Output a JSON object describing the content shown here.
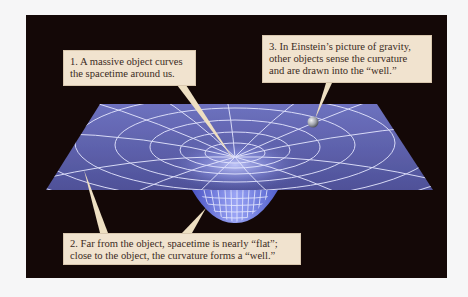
{
  "figure": {
    "colors": {
      "page_background": "#f6f6f7",
      "panel_background": "#140807",
      "sheet_fill": "#5b5ea8",
      "grid_lines": "#e6e8ff",
      "well_fill": "#7d86e0",
      "callout_fill": "#f1e3cf",
      "callout_text": "#3a2a22",
      "pointer_fill": "#eedfc2",
      "ball": "#b8bcc4"
    },
    "callouts": [
      {
        "id": "1",
        "lines": [
          "1.  A massive object curves",
          "the spacetime around us."
        ]
      },
      {
        "id": "2",
        "lines": [
          "2.  Far from the object, spacetime is nearly “flat”;",
          "close to the object, the curvature forms a “well.”"
        ]
      },
      {
        "id": "3",
        "lines": [
          "3.  In Einstein’s picture of gravity,",
          "other objects sense the curvature",
          "and are drawn into the “well.”"
        ]
      }
    ],
    "elements": {
      "sheet": "curved spacetime grid sheet",
      "well": "gravity well funnel",
      "ball": "small orbiting object"
    }
  }
}
